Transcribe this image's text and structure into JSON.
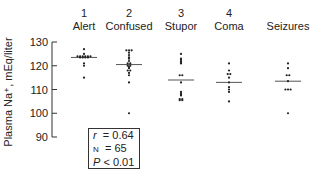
{
  "chart_data": {
    "type": "scatter",
    "title": "",
    "xlabel": "",
    "ylabel": "Plasma Na⁺, mEq/liter",
    "ylim": [
      90,
      130
    ],
    "yticks": [
      90,
      100,
      110,
      120,
      130
    ],
    "groups": [
      {
        "num": "1",
        "name": "Alert",
        "median": 123.5,
        "values": [
          127,
          125,
          124,
          124,
          124,
          124,
          124,
          124,
          123.5,
          123.5,
          123.5,
          123.5,
          121,
          120,
          115
        ]
      },
      {
        "num": "2",
        "name": "Confused",
        "median": 120.5,
        "values": [
          126.5,
          126.5,
          126.5,
          125.5,
          124.5,
          123.5,
          123,
          122,
          121,
          121,
          120,
          120,
          119.5,
          119,
          118,
          118,
          117,
          116,
          113,
          100
        ]
      },
      {
        "num": "3",
        "name": "Stupor",
        "median": 114,
        "values": [
          125,
          123,
          122.5,
          122,
          121.5,
          121,
          116,
          116,
          113,
          109,
          108.5,
          108,
          107.5,
          106,
          106,
          105.5,
          105.5
        ]
      },
      {
        "num": "4",
        "name": "Coma",
        "median": 113,
        "values": [
          121,
          118,
          116.5,
          116.5,
          115,
          113,
          111,
          110,
          109,
          105
        ]
      },
      {
        "num": "",
        "name": "Seizures",
        "median": 113.5,
        "values": [
          121,
          119,
          116,
          116,
          113.5,
          110,
          110,
          110,
          100
        ]
      }
    ],
    "stats": {
      "r": "0.64",
      "n": "65",
      "p": "0.01"
    }
  },
  "labels": {
    "r_label": "r",
    "n_label": "N",
    "p_label": "P",
    "r_line": "= 0.64",
    "n_line": "= 65",
    "p_line": "< 0.01"
  }
}
